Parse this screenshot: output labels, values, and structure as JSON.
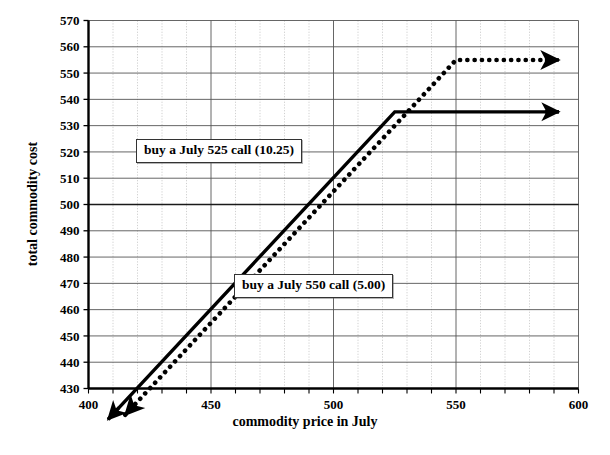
{
  "chart_data": {
    "type": "line",
    "title": "",
    "xlabel": "commodity price in July",
    "ylabel": "total commodity cost",
    "xlim": [
      400,
      600
    ],
    "ylim": [
      430,
      570
    ],
    "xticks": [
      400,
      450,
      500,
      550,
      600
    ],
    "xticklabels": [
      "400",
      "450",
      "500",
      "550",
      "600"
    ],
    "xminor_step": 10,
    "yticks": [
      430,
      440,
      450,
      460,
      470,
      480,
      490,
      500,
      510,
      520,
      530,
      540,
      550,
      560,
      570
    ],
    "yticklabels": [
      "430",
      "440",
      "450",
      "460",
      "470",
      "480",
      "490",
      "500",
      "510",
      "520",
      "530",
      "540",
      "550",
      "560",
      "570"
    ],
    "grid": true,
    "grid_major_color": "#555555",
    "grid_minor_color": "#bbbbbb",
    "emphasis_gridline_y": 500,
    "legend": "annotations",
    "series": [
      {
        "name": "buy a July 525 call (10.25)",
        "style": "solid",
        "color": "#000000",
        "strike": 525,
        "premium": 10.25,
        "plateau": 535.25,
        "points": [
          [
            408,
            418.25
          ],
          [
            525,
            535.25
          ],
          [
            592,
            535.25
          ]
        ],
        "arrow_start": true,
        "arrow_end": true
      },
      {
        "name": "buy a July 550 call (5.00)",
        "style": "dotted",
        "color": "#000000",
        "strike": 550,
        "premium": 5.0,
        "plateau": 555.0,
        "points": [
          [
            415,
            420.0
          ],
          [
            550,
            555.0
          ],
          [
            592,
            555.0
          ]
        ],
        "arrow_start": true,
        "arrow_end": true
      }
    ],
    "annotations": [
      {
        "text": "buy a July 525 call (10.25)",
        "x": 419,
        "y": 522
      },
      {
        "text": "buy a July 550 call (5.00)",
        "x": 459,
        "y": 471
      }
    ]
  },
  "labels": {
    "xaxis_title": "commodity price in July",
    "yaxis_title": "total commodity cost",
    "annotation_525": "buy a July 525 call (10.25)",
    "annotation_550": "buy a July 550 call (5.00)"
  }
}
